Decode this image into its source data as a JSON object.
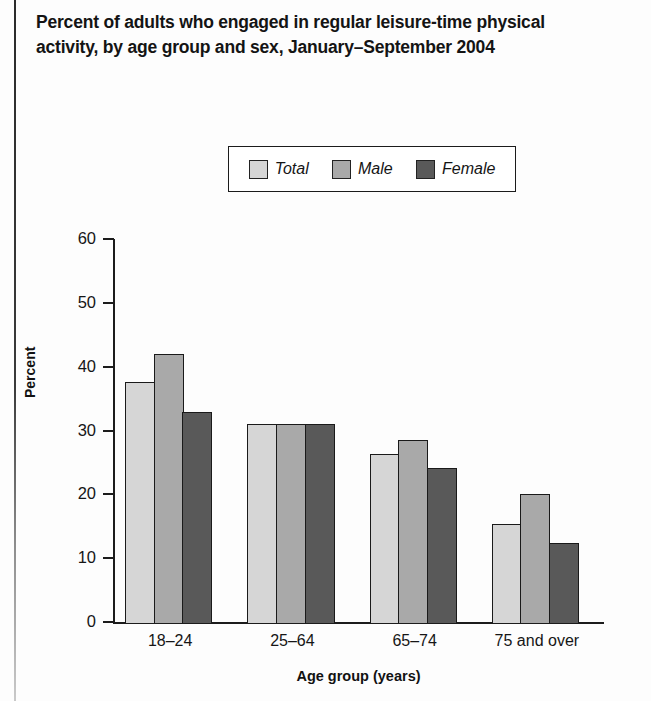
{
  "page": {
    "title": "Percent of adults who engaged in regular leisure-time physical activity, by age group and sex, January–September 2004"
  },
  "chart_data": {
    "type": "bar",
    "title": "Percent of adults who engaged in regular leisure-time physical activity, by age group and sex, January–September 2004",
    "xlabel": "Age group (years)",
    "ylabel": "Percent",
    "categories": [
      "18–24",
      "25–64",
      "65–74",
      "75 and over"
    ],
    "series": [
      {
        "name": "Total",
        "color": "#d6d6d6",
        "values": [
          37.8,
          31.2,
          26.4,
          15.5
        ]
      },
      {
        "name": "Male",
        "color": "#a9a9a9",
        "values": [
          42.1,
          31.2,
          28.6,
          20.2
        ]
      },
      {
        "name": "Female",
        "color": "#595959",
        "values": [
          33.0,
          31.2,
          24.3,
          12.5
        ]
      }
    ],
    "ylim": [
      0,
      60
    ],
    "yticks": [
      0,
      10,
      20,
      30,
      40,
      50,
      60
    ],
    "ytick_labels": [
      "0",
      "10",
      "20",
      "30",
      "40",
      "50",
      "60"
    ],
    "grid": false,
    "legend_position": "top-center",
    "legend_entries": [
      "Total",
      "Male",
      "Female"
    ]
  }
}
